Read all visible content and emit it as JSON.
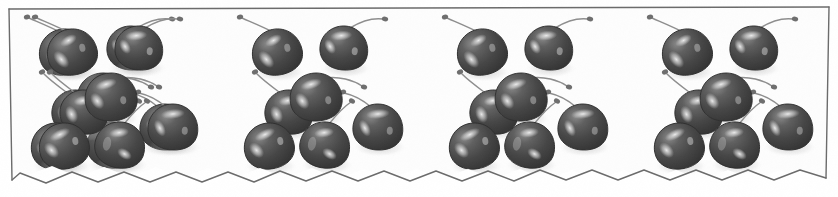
{
  "image": {
    "title": "Cherry border strip",
    "description": "Scanned grayscale decorative border strip showing four repeating panels of cherries",
    "width": 838,
    "height": 197,
    "background_color": "#ffffff",
    "paper_color": "#fdfdfd",
    "ink_color": "#5a5a5a",
    "media": "grayscale scan"
  },
  "frame": {
    "name": "strip-frame",
    "border_color": "#6b6b6b",
    "border_width": 1.4,
    "top_edge": {
      "type": "straight",
      "y_left": 9,
      "y_right": 7
    },
    "left_edge": {
      "type": "straight",
      "x_top": 9,
      "x_bottom": 12
    },
    "right_edge": {
      "type": "straight",
      "x_top": 829,
      "x_bottom": 826
    },
    "bottom_edge": {
      "type": "zigzag",
      "label": "torn zigzag deckle edge",
      "amplitude": 11,
      "teeth": 16,
      "baseline_y": 180
    }
  },
  "pattern": {
    "name": "cherry-repeat-pattern",
    "panel_count": 4,
    "panel_width": 205,
    "panel_offsets": [
      8,
      213,
      418,
      623
    ],
    "cherries_per_panel": 7,
    "total_cherries": 28
  },
  "cherry_style": {
    "body_dark": "#3f3f3f",
    "body_mid": "#555555",
    "body_light": "#777777",
    "highlight": "#e9e9e9",
    "highlight_soft": "#c8c8c8",
    "outline": "#2e2e2e",
    "stem_color": "#8e8e8e",
    "stem_width": 1.5,
    "shadow": "#b9b9b9"
  },
  "cherries": [
    {
      "id": "cherry-1",
      "label": "upper-left cherry",
      "cx": 64,
      "cy": 52,
      "rx": 25,
      "ry": 23,
      "rot": -12,
      "stem_tip_x": 26,
      "stem_tip_y": 17,
      "stem_dir": "left-up",
      "curve": "s"
    },
    {
      "id": "cherry-2",
      "label": "upper-center cherry",
      "cx": 76,
      "cy": 112,
      "rx": 24,
      "ry": 22,
      "rot": 8,
      "stem_tip_x": 42,
      "stem_tip_y": 72,
      "stem_dir": "left-up",
      "curve": "c"
    },
    {
      "id": "cherry-3",
      "label": "upper-right cherry",
      "cx": 131,
      "cy": 48,
      "rx": 24,
      "ry": 22,
      "rot": 6,
      "stem_tip_x": 172,
      "stem_tip_y": 18,
      "stem_dir": "right-up",
      "curve": "s"
    },
    {
      "id": "cherry-4",
      "label": "center cherry",
      "cx": 103,
      "cy": 97,
      "rx": 26,
      "ry": 24,
      "rot": -4,
      "stem_tip_x": 150,
      "stem_tip_y": 86,
      "stem_dir": "right",
      "curve": "c"
    },
    {
      "id": "cherry-5",
      "label": "lower-left cherry",
      "cx": 56,
      "cy": 146,
      "rx": 25,
      "ry": 23,
      "rot": -10,
      "stem_tip_x": 74,
      "stem_tip_y": 104,
      "stem_dir": "right-up",
      "curve": "c"
    },
    {
      "id": "cherry-6",
      "label": "lower-center cherry",
      "cx": 112,
      "cy": 145,
      "rx": 25,
      "ry": 23,
      "rot": 10,
      "stem_tip_x": 139,
      "stem_tip_y": 100,
      "stem_dir": "right-up",
      "curve": "c"
    },
    {
      "id": "cherry-7",
      "label": "lower-right cherry",
      "cx": 165,
      "cy": 127,
      "rx": 25,
      "ry": 23,
      "rot": 4,
      "stem_tip_x": 129,
      "stem_tip_y": 92,
      "stem_dir": "left-up",
      "curve": "c"
    }
  ]
}
